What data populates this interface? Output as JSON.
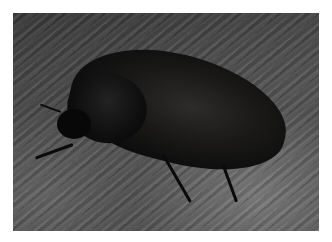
{
  "image": {
    "description": "Close-up photograph of a dark, matte black beetle resting on weathered grey wood with diagonal grain",
    "subject": "beetle",
    "background": "weathered wood grain",
    "border_color": "#ffffff",
    "dominant_colors": [
      "#0a0a0a",
      "#3a3a3a",
      "#6e6e6e",
      "#ffffff"
    ]
  }
}
